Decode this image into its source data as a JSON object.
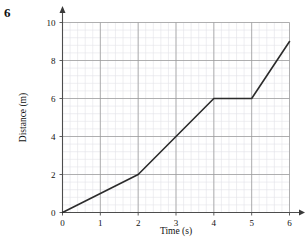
{
  "question": {
    "number": "6"
  },
  "chart_data": {
    "type": "line",
    "title": "",
    "xlabel": "Time (s)",
    "ylabel": "Distance (m)",
    "xlim": [
      0,
      6
    ],
    "ylim": [
      0,
      10
    ],
    "xticks": [
      "0",
      "1",
      "2",
      "3",
      "4",
      "5",
      "6"
    ],
    "yticks": [
      "0",
      "2",
      "4",
      "6",
      "8",
      "10"
    ],
    "xtick_values": [
      0,
      1,
      2,
      3,
      4,
      5,
      6
    ],
    "ytick_values": [
      0,
      2,
      4,
      6,
      8,
      10
    ],
    "grid": true,
    "grid_major_step_x": 1,
    "grid_major_step_y": 2,
    "grid_minor_divisions": 5,
    "legend": null,
    "series": [
      {
        "name": "Distance travelled",
        "x": [
          0,
          2,
          4,
          5,
          6
        ],
        "values": [
          0,
          2,
          6,
          6,
          9
        ],
        "color": "#2b2b2b"
      }
    ],
    "annotations": []
  },
  "colors": {
    "axis": "#4d4d4d",
    "grid_major": "#9a9a9a",
    "grid_minor": "#e2e2e8",
    "line": "#2b2b2b",
    "text": "#111111",
    "background": "#ffffff"
  }
}
